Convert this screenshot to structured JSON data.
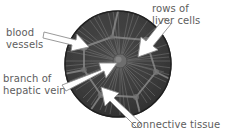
{
  "figure": {
    "background_color": "#ffffff",
    "lobule": {
      "name": "liver-lobule-circle",
      "fill_color": "#3b3b3b",
      "outline_color": "#2a2a2a",
      "center_x": 118,
      "center_y": 64,
      "radius_x": 53,
      "radius_y": 53,
      "central_vein": {
        "name": "central-vein",
        "fill_color": "#6a6a6a",
        "center_x": 120,
        "center_y": 61,
        "radius": 7
      },
      "radiating_rows_count": 46,
      "septa_count": 6
    },
    "arrow_color": "#ffffff",
    "arrow_outline_color": "#8a8a8a",
    "text_color": "#5d5d5d"
  },
  "labels": [
    {
      "id": "blood-vessels",
      "lines": [
        "blood",
        "vessels"
      ],
      "text": "blood\nvessels",
      "points_to": "blood-vessels"
    },
    {
      "id": "rows-of-liver-cells",
      "lines": [
        "rows of",
        "liver cells"
      ],
      "text": "rows of\nliver cells",
      "points_to": "rows-of-liver-cells"
    },
    {
      "id": "branch-of-hepatic-vein",
      "lines": [
        "branch of",
        "hepatic vein"
      ],
      "text": "branch of\nhepatic vein",
      "points_to": "central-vein"
    },
    {
      "id": "connective-tissue",
      "lines": [
        "connective tissue"
      ],
      "text": "connective tissue",
      "points_to": "connective-tissue"
    }
  ]
}
